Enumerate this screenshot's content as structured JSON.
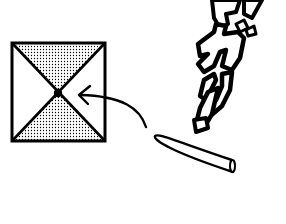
{
  "illustration": {
    "title": "Pyramid top view with marked apex",
    "pyramid": {
      "view": "top-down",
      "shaded_faces": [
        "top",
        "bottom"
      ],
      "unshaded_faces": [
        "left",
        "right"
      ],
      "apex_marker": "filled-dot"
    },
    "arrow": {
      "points_to": "apex"
    },
    "object": {
      "name": "stick"
    },
    "sound_effect": {
      "text": "がり",
      "reading": "gari"
    },
    "colors": {
      "ink": "#000000",
      "paper": "#ffffff",
      "screen_tone": "#000000"
    }
  }
}
